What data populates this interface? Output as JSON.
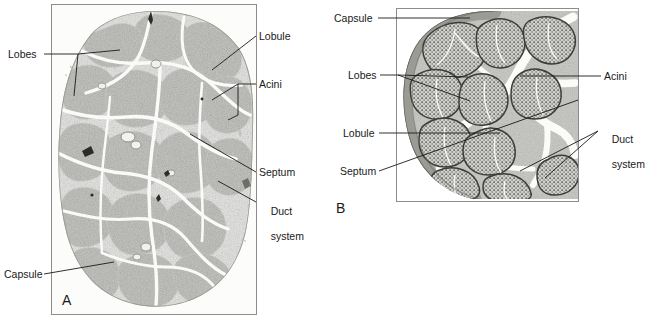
{
  "figure": {
    "background_color": "#ffffff",
    "line_color": "#1a1a1a",
    "frame_color": "#8c8c8c"
  },
  "panels": [
    {
      "id": "A",
      "letter": "A",
      "type": "micrograph",
      "caption": "Low-power photomicrograph of a sectioned exocrine gland showing lobes separated by connective-tissue septa",
      "frame": {
        "x": 51,
        "y": 4,
        "width": 206,
        "height": 311
      },
      "labels": [
        {
          "name": "lobes",
          "text": "Lobes",
          "x": 8,
          "y": 50,
          "side": "left",
          "bracket": true
        },
        {
          "name": "capsule",
          "text": "Capsule",
          "x": 4,
          "y": 270,
          "side": "left",
          "bracket": false
        },
        {
          "name": "lobule",
          "text": "Lobule",
          "x": 259,
          "y": 30,
          "side": "right",
          "bracket": false
        },
        {
          "name": "acini",
          "text": "Acini",
          "x": 259,
          "y": 78,
          "side": "right",
          "bracket": true
        },
        {
          "name": "septum",
          "text": "Septum",
          "x": 259,
          "y": 169,
          "side": "right",
          "bracket": false
        },
        {
          "name": "duct-system",
          "text": "Duct\nsystem",
          "x": 259,
          "y": 196,
          "side": "right",
          "bracket": false
        }
      ]
    },
    {
      "id": "B",
      "letter": "B",
      "type": "illustration",
      "caption": "Schematic drawing of the same gland indicating capsule, lobes, lobule, septum, acini and duct system",
      "frame": {
        "x": 396,
        "y": 8,
        "width": 183,
        "height": 194
      },
      "labels": [
        {
          "name": "capsule",
          "text": "Capsule",
          "x": 334,
          "y": 12,
          "side": "left",
          "bracket": false
        },
        {
          "name": "lobes",
          "text": "Lobes",
          "x": 348,
          "y": 69,
          "side": "left",
          "bracket": true
        },
        {
          "name": "lobule",
          "text": "Lobule",
          "x": 343,
          "y": 127,
          "side": "left",
          "bracket": false
        },
        {
          "name": "septum",
          "text": "Septum",
          "x": 340,
          "y": 165,
          "side": "left",
          "bracket": false
        },
        {
          "name": "acini",
          "text": "Acini",
          "x": 604,
          "y": 70,
          "side": "right",
          "bracket": false
        },
        {
          "name": "duct-system",
          "text": "Duct\nsystem",
          "x": 600,
          "y": 124,
          "side": "right",
          "bracket": false
        }
      ]
    }
  ],
  "terms": {
    "lobes": "Lobes",
    "lobule": "Lobule",
    "acini": "Acini",
    "septum": "Septum",
    "duct_system_line1": "Duct",
    "duct_system_line2": "system",
    "capsule": "Capsule"
  },
  "letters": {
    "a": "A",
    "b": "B"
  }
}
